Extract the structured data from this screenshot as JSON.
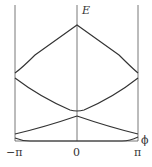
{
  "diagram": {
    "type": "band-structure",
    "y_axis_label": "E",
    "x_axis_label": "ϕ",
    "x_ticks": [
      "−π",
      "0",
      "π"
    ],
    "line_color": "#333333",
    "axis_color": "#555555",
    "bands": [
      {
        "name": "band-1",
        "description": "lowest band, nearly flat near baseline, rising toward ±π"
      },
      {
        "name": "band-2",
        "description": "peaks at 0, minimum at ±π"
      },
      {
        "name": "band-3",
        "description": "minimum at 0, maximum at ±π"
      },
      {
        "name": "band-4",
        "description": "highest band, cusp peak at 0, minimum at ±π"
      }
    ]
  }
}
